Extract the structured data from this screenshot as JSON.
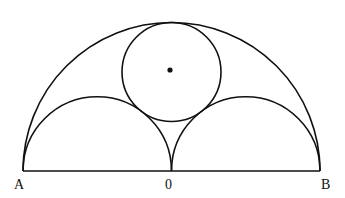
{
  "diagram": {
    "type": "arbelos-inscribed-circle",
    "stroke_color": "#111111",
    "background": "#ffffff",
    "baseline": {
      "from": "A",
      "to": "B"
    },
    "points": [
      {
        "id": "A",
        "label": "A"
      },
      {
        "id": "O",
        "label": "0"
      },
      {
        "id": "B",
        "label": "B"
      }
    ],
    "shapes": [
      {
        "id": "large-semicircle",
        "description": "Semicircle on diameter AB"
      },
      {
        "id": "left-semicircle",
        "description": "Semicircle on diameter A0"
      },
      {
        "id": "right-semicircle",
        "description": "Semicircle on diameter 0B"
      },
      {
        "id": "inscribed-circle",
        "description": "Circle tangent to all three semicircles"
      },
      {
        "id": "center-dot",
        "description": "Center of inscribed circle"
      }
    ]
  }
}
